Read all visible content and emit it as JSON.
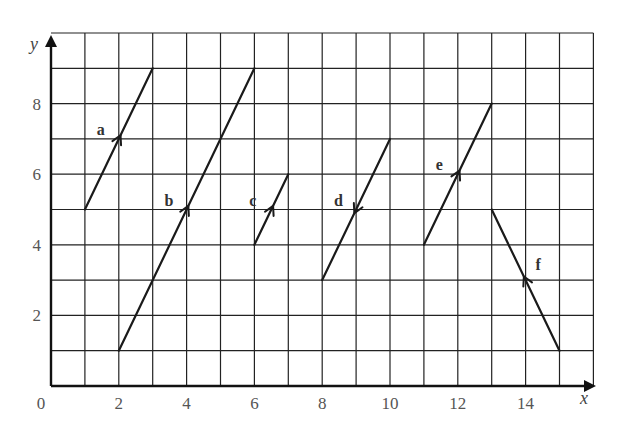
{
  "figure": {
    "type": "vector-grid-diagram",
    "x_axis": {
      "label": "x",
      "min": 0,
      "max": 16,
      "tick_labels": [
        "0",
        "2",
        "4",
        "6",
        "8",
        "10",
        "12",
        "14"
      ]
    },
    "y_axis": {
      "label": "y",
      "min": 0,
      "max": 10,
      "tick_labels": [
        "2",
        "4",
        "6",
        "8"
      ]
    },
    "grid": true,
    "vectors": [
      {
        "label": "a",
        "from": [
          1,
          5
        ],
        "to": [
          3,
          9
        ],
        "arrow_direction": "forward"
      },
      {
        "label": "b",
        "from": [
          2,
          1
        ],
        "to": [
          6,
          9
        ],
        "arrow_direction": "forward"
      },
      {
        "label": "c",
        "from": [
          6,
          4
        ],
        "to": [
          7,
          6
        ],
        "arrow_direction": "forward"
      },
      {
        "label": "d",
        "from": [
          10,
          7
        ],
        "to": [
          8,
          3
        ],
        "arrow_direction": "forward"
      },
      {
        "label": "e",
        "from": [
          11,
          4
        ],
        "to": [
          13,
          8
        ],
        "arrow_direction": "forward"
      },
      {
        "label": "f",
        "from": [
          15,
          1
        ],
        "to": [
          13,
          5
        ],
        "arrow_direction": "forward"
      }
    ],
    "colors": {
      "line": "#1a1a1a",
      "grid": "#222222",
      "tick_text": "#555555"
    }
  }
}
